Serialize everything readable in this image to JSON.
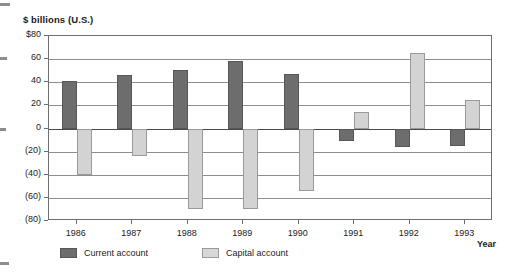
{
  "chart_data": {
    "type": "bar",
    "title": "",
    "ylabel": "$ billions (U.S.)",
    "xlabel": "Year",
    "categories": [
      "1986",
      "1987",
      "1988",
      "1989",
      "1990",
      "1991",
      "1992",
      "1993"
    ],
    "series": [
      {
        "name": "Current account",
        "color": "#6d6d6d",
        "values": [
          41,
          46,
          51,
          58,
          47,
          -11,
          -16,
          -15
        ]
      },
      {
        "name": "Capital account",
        "color": "#d3d3d3",
        "values": [
          -40,
          -24,
          -70,
          -70,
          -54,
          14,
          65,
          25
        ]
      }
    ],
    "ylim": [
      -80,
      80
    ],
    "ytick_values": [
      80,
      60,
      40,
      20,
      0,
      -20,
      -40,
      -60,
      -80
    ],
    "ytick_labels": [
      "$80",
      "60",
      "40",
      "20",
      "0",
      "(20)",
      "(40)",
      "(60)",
      "(80)"
    ],
    "grid": true,
    "legend_position": "bottom"
  },
  "legend": {
    "items": [
      {
        "label": "Current account",
        "swatch": "dark-gray-swatch"
      },
      {
        "label": "Capital account",
        "swatch": "light-gray-swatch"
      }
    ]
  }
}
